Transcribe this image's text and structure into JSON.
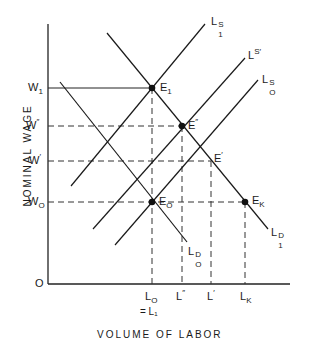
{
  "diagram": {
    "type": "labor market supply and demand diagram",
    "y_axis": {
      "title": "NOMINAL WAGE",
      "origin_label": "O",
      "ticks": [
        {
          "main": "W",
          "sub": "1",
          "y": 88
        },
        {
          "main": "W",
          "sub": "″",
          "y": 126
        },
        {
          "main": "W",
          "sub": "′",
          "y": 161
        },
        {
          "main": "W",
          "sub": "O",
          "y": 202
        }
      ]
    },
    "x_axis": {
      "title": "VOLUME OF LABOR",
      "ticks": [
        {
          "main": "L",
          "sub": "O",
          "x": 152,
          "note": "= L₁"
        },
        {
          "main": "L",
          "sub": "″",
          "x": 182
        },
        {
          "main": "L",
          "sub": "′",
          "x": 211
        },
        {
          "main": "L",
          "sub": "K",
          "x": 245
        }
      ]
    },
    "curves": [
      {
        "id": "L1S",
        "label_main": "L",
        "label_sup": "S",
        "label_sub": "1",
        "kind": "supply"
      },
      {
        "id": "LSprime",
        "label_main": "L",
        "label_sup": "S′",
        "label_sub": "",
        "kind": "supply"
      },
      {
        "id": "L0S",
        "label_main": "L",
        "label_sup": "S",
        "label_sub": "O",
        "kind": "supply"
      },
      {
        "id": "L1D",
        "label_main": "L",
        "label_sup": "D",
        "label_sub": "1",
        "kind": "demand"
      },
      {
        "id": "L0D",
        "label_main": "L",
        "label_sup": "D",
        "label_sub": "O",
        "kind": "demand"
      }
    ],
    "points": [
      {
        "id": "E1",
        "main": "E",
        "sub": "1",
        "dot": true
      },
      {
        "id": "Edouble",
        "main": "E",
        "sub": "″",
        "dot": true
      },
      {
        "id": "Eprime",
        "main": "E",
        "sub": "′",
        "dot": false
      },
      {
        "id": "E0",
        "main": "E",
        "sub": "O",
        "dot": true
      },
      {
        "id": "EK",
        "main": "E",
        "sub": "K",
        "dot": true
      }
    ]
  }
}
